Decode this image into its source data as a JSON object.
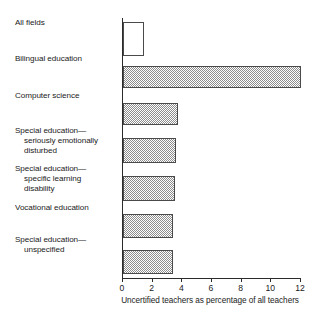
{
  "chart_data": {
    "type": "bar",
    "orientation": "horizontal",
    "title": "",
    "subtitle": "",
    "xlabel": "Uncertified teachers as percentage of all teachers",
    "ylabel": "",
    "xlim": [
      0,
      12
    ],
    "xticks": [
      0,
      2,
      4,
      6,
      8,
      10,
      12
    ],
    "xtick_labels": [
      "0",
      "2",
      "4",
      "6",
      "8",
      "10",
      "12"
    ],
    "grid": false,
    "legend": false,
    "categories": [
      "All fields",
      "Bilingual education",
      "Computer science",
      "Special education—seriously emotionally disturbed",
      "Special education—specific learning disability",
      "Vocational education",
      "Special education—unspecified"
    ],
    "values": [
      1.4,
      12.0,
      3.7,
      3.6,
      3.5,
      3.4,
      3.4
    ],
    "bars": [
      {
        "label_lines": [
          "All fields"
        ],
        "value": 1.4,
        "fill": "none",
        "top": 4,
        "height": 34
      },
      {
        "label_lines": [
          "Bilingual education"
        ],
        "value": 12.0,
        "fill": "hatched",
        "top": 48,
        "height": 22
      },
      {
        "label_lines": [
          "Computer science"
        ],
        "value": 3.7,
        "fill": "hatched",
        "top": 85,
        "height": 22
      },
      {
        "label_lines": [
          "Special education—",
          "seriously emotionally",
          "disturbed"
        ],
        "value": 3.6,
        "fill": "hatched",
        "top": 120,
        "height": 25
      },
      {
        "label_lines": [
          "Special education—",
          "specific learning",
          "disability"
        ],
        "value": 3.5,
        "fill": "hatched",
        "top": 158,
        "height": 25
      },
      {
        "label_lines": [
          "Vocational education"
        ],
        "value": 3.4,
        "fill": "hatched",
        "top": 196,
        "height": 24
      },
      {
        "label_lines": [
          "Special education—",
          "unspecified"
        ],
        "value": 3.4,
        "fill": "hatched",
        "top": 232,
        "height": 24
      }
    ],
    "colors": {
      "axis": "#2b2b2b",
      "bar_outline": "#4a4a4a",
      "bar_fill_hatch": "#8d8d8d",
      "bar_fill_empty": "#ffffff",
      "background": "#ffffff",
      "text": "#1a1a1a"
    }
  }
}
